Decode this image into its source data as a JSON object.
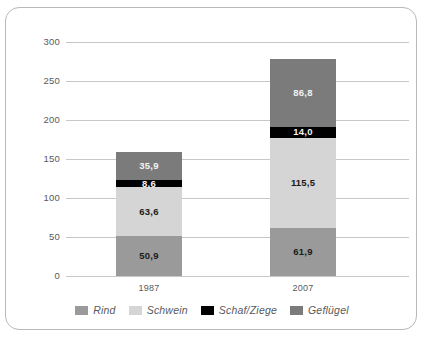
{
  "chart_data": {
    "type": "bar",
    "stacked": true,
    "title": "",
    "subtitle": "",
    "xlabel": "",
    "ylabel": "",
    "categories": [
      "1987",
      "2007"
    ],
    "ylim": [
      0,
      300
    ],
    "yticks": [
      0,
      50,
      100,
      150,
      200,
      250,
      300
    ],
    "ytick_labels": [
      "0",
      "50",
      "100",
      "150",
      "200",
      "250",
      "300"
    ],
    "grid": true,
    "legend_position": "bottom",
    "series": [
      {
        "name": "Rind",
        "color": "#9a9a9a",
        "values": [
          50.9,
          61.9
        ],
        "value_labels": [
          "50,9",
          "61,9"
        ]
      },
      {
        "name": "Schwein",
        "color": "#d5d5d5",
        "values": [
          63.6,
          115.5
        ],
        "value_labels": [
          "63,6",
          "115,5"
        ]
      },
      {
        "name": "Schaf/Ziege",
        "color": "#000000",
        "values": [
          8.6,
          14.0
        ],
        "value_labels": [
          "8,6",
          "14,0"
        ]
      },
      {
        "name": "Geflügel",
        "color": "#7b7b7b",
        "values": [
          35.9,
          86.8
        ],
        "value_labels": [
          "35,9",
          "86,8"
        ]
      }
    ],
    "totals": [
      158.9,
      278.2
    ]
  },
  "axis": {
    "y_labels": [
      "300",
      "250",
      "200",
      "150",
      "100",
      "50",
      "0"
    ],
    "x_labels": [
      "1987",
      "2007"
    ]
  },
  "legend": {
    "items": [
      {
        "label": "Rind",
        "swatch": "legend-swatch-rind"
      },
      {
        "label": "Schwein",
        "swatch": "legend-swatch-schwein"
      },
      {
        "label": "Schaf/Ziege",
        "swatch": "legend-swatch-schaf-ziege"
      },
      {
        "label": "Geflügel",
        "swatch": "legend-swatch-gefluegel"
      }
    ]
  },
  "colors": {
    "rind": "#9a9a9a",
    "schwein": "#d5d5d5",
    "schaf_ziege": "#000000",
    "gefluegel": "#7b7b7b",
    "grid": "#c8c8c8",
    "border": "#b9b9b9",
    "text": "#58595b"
  }
}
